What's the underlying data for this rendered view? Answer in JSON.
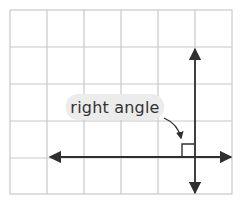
{
  "diagram": {
    "title": "",
    "label": "right angle",
    "grid": {
      "columns": 6,
      "rows": 5,
      "x_lines": [
        10,
        47,
        84,
        121,
        158,
        195,
        232
      ],
      "y_lines": [
        10,
        47,
        84,
        121,
        158,
        194
      ],
      "line_color": "#c8c8c8"
    },
    "lines": [
      {
        "name": "horizontal-line",
        "orientation": "horizontal",
        "from": [
          48,
          157
        ],
        "to": [
          232,
          157
        ],
        "arrows": "both"
      },
      {
        "name": "vertical-line",
        "orientation": "vertical",
        "from": [
          195,
          47
        ],
        "to": [
          195,
          194
        ],
        "arrows": "both"
      }
    ],
    "right_angle_marker": {
      "x": 182,
      "y": 144,
      "size": 13
    },
    "colors": {
      "line": "#2f2f2f",
      "label_bg": "#ececec",
      "label_text": "#333333"
    }
  }
}
